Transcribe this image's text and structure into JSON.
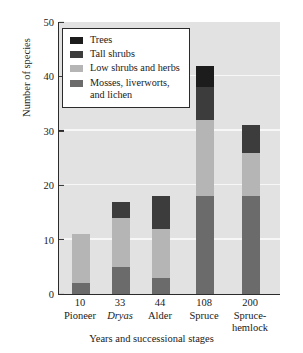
{
  "chart_data": {
    "type": "bar",
    "subtype": "stacked-bar",
    "title": "",
    "xlabel": "Years and successional stages",
    "ylabel": "Number of species",
    "ylim": [
      0,
      50
    ],
    "yticks": [
      0,
      10,
      20,
      30,
      40,
      50
    ],
    "grid": "horizontal-white",
    "legend_position": "upper-left-inside",
    "categories": [
      "10\nPioneer",
      "33\nDryas",
      "44\nAlder",
      "108\nSpruce",
      "200\nSpruce-hemlock"
    ],
    "category_years": [
      "10",
      "33",
      "44",
      "108",
      "200"
    ],
    "category_stages": [
      "Pioneer",
      "Dryas",
      "Alder",
      "Spruce",
      "Spruce-\nhemlock"
    ],
    "series": [
      {
        "name": "Mosses, liverworts,\nand lichen",
        "color": "#6b6b6b",
        "values": [
          2,
          5,
          3,
          18,
          18
        ]
      },
      {
        "name": "Low shrubs and herbs",
        "color": "#b5b5b5",
        "values": [
          9,
          9,
          9,
          14,
          8
        ]
      },
      {
        "name": "Tall shrubs",
        "color": "#3c3c3c",
        "values": [
          0,
          3,
          6,
          6,
          5
        ]
      },
      {
        "name": "Trees",
        "color": "#1c1c1c",
        "values": [
          0,
          0,
          0,
          4,
          0
        ]
      }
    ],
    "totals": [
      11,
      17,
      18,
      42,
      31
    ]
  },
  "legend": {
    "items": [
      {
        "label": "Trees",
        "color": "#1c1c1c"
      },
      {
        "label": "Tall shrubs",
        "color": "#3c3c3c"
      },
      {
        "label": "Low shrubs and herbs",
        "color": "#b5b5b5"
      },
      {
        "label": "Mosses, liverworts,\nand lichen",
        "color": "#6b6b6b"
      }
    ]
  },
  "axes": {
    "y_title": "Number of species",
    "x_title": "Years and successional stages",
    "y_tick_labels": [
      "0",
      "10",
      "20",
      "30",
      "40",
      "50"
    ]
  },
  "colors": {
    "plot_background": "#e2e2e2",
    "gridline": "#f7f7f7",
    "axis": "#2b2b2b",
    "legend_background": "#ffffff"
  }
}
